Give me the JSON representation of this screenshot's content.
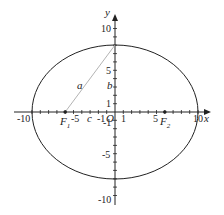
{
  "diagram": {
    "type": "ellipse",
    "colors": {
      "axis": "#222222",
      "ellipse": "#222222",
      "segment": "#aaaaaa",
      "text": "#222222"
    },
    "ellipse": {
      "a": 10,
      "b": 8,
      "c": 6
    },
    "axes": {
      "x_label": "x",
      "y_label": "y",
      "origin_label": "O",
      "x_ticks": {
        "neg10": "-10",
        "neg5": "-5",
        "neg1": "-1",
        "pos1": "1",
        "pos5": "5",
        "pos10": "10"
      },
      "y_ticks": {
        "pos10": "10",
        "pos5": "5",
        "pos1": "1",
        "neg1": "-1",
        "neg5": "-5",
        "neg10": "-10"
      }
    },
    "foci": {
      "f1": {
        "label": "F",
        "sub": "1",
        "x": -6
      },
      "f2": {
        "label": "F",
        "sub": "2",
        "x": 6
      }
    },
    "segment_labels": {
      "a": "a",
      "b": "b",
      "c": "c"
    }
  }
}
